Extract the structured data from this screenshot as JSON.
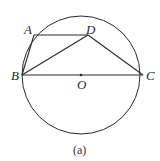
{
  "figure": {
    "caption": "(a)",
    "circle": {
      "center_label": "O",
      "cx": 81,
      "cy": 75,
      "r": 59
    },
    "points": {
      "A": {
        "label": "A",
        "x": 34,
        "y": 35
      },
      "B": {
        "label": "B",
        "x": 22,
        "y": 75
      },
      "C": {
        "label": "C",
        "x": 143,
        "y": 75
      },
      "D": {
        "label": "D",
        "x": 88,
        "y": 35
      },
      "O": {
        "label": "O",
        "x": 81,
        "y": 75
      }
    },
    "segments": [
      "AB",
      "AD",
      "BD",
      "DC",
      "BC"
    ],
    "stroke_color": "#2a2a2a"
  }
}
